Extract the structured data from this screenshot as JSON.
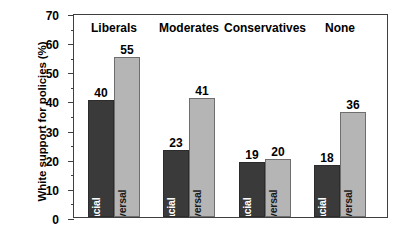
{
  "chart_data": {
    "type": "bar",
    "title": "",
    "xlabel": "",
    "ylabel": "White support for policies (%)",
    "ylim": [
      0,
      70
    ],
    "y_major_step": 10,
    "y_minor_step": 5,
    "grid": false,
    "legend": "in-bar",
    "categories": [
      "Liberals",
      "Moderates",
      "Conservatives",
      "None"
    ],
    "series": [
      {
        "name": "Racial",
        "color": "#3a3a3a",
        "label_color": "#ffffff",
        "values": [
          40,
          23,
          19,
          18
        ]
      },
      {
        "name": "Universal",
        "color": "#b5b5b5",
        "label_color": "#1a1a1a",
        "values": [
          55,
          41,
          20,
          36
        ]
      }
    ],
    "y_ticks": [
      {
        "value": 0,
        "label": "0"
      },
      {
        "value": 10,
        "label": "10"
      },
      {
        "value": 20,
        "label": "20"
      },
      {
        "value": 30,
        "label": "30"
      },
      {
        "value": 40,
        "label": "40"
      },
      {
        "value": 50,
        "label": "50"
      },
      {
        "value": 60,
        "label": "60"
      },
      {
        "value": 70,
        "label": "70"
      }
    ],
    "y_minor_ticks": [
      5,
      15,
      25,
      35,
      45,
      55,
      65
    ],
    "value_labels": [
      "40",
      "55",
      "23",
      "41",
      "19",
      "20",
      "18",
      "36"
    ],
    "axis_color": "#3f3f3f",
    "background": "#ffffff"
  }
}
